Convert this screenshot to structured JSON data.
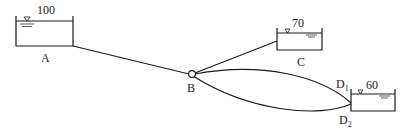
{
  "diagram": {
    "type": "reservoir-pipe-network",
    "reservoirs": [
      {
        "id": "A",
        "label": "A",
        "level": "100"
      },
      {
        "id": "C",
        "label": "C",
        "level": "70"
      },
      {
        "id": "D",
        "label": "D",
        "level": "60"
      }
    ],
    "junction": {
      "label": "B"
    },
    "pipe_ends": [
      {
        "label": "D",
        "sub": "1"
      },
      {
        "label": "D",
        "sub": "2"
      }
    ],
    "colors": {
      "line": "#1a1a1a",
      "background": "#ffffff"
    }
  }
}
